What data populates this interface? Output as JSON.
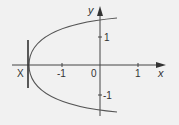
{
  "diagram": {
    "type": "parabola-graph",
    "axes": {
      "x_label": "x",
      "y_label": "y",
      "origin_label": "0",
      "x_ticks": [
        {
          "value": -1,
          "label": "-1"
        },
        {
          "value": 1,
          "label": "1"
        }
      ],
      "y_ticks": [
        {
          "value": 1,
          "label": "1"
        },
        {
          "value": -1,
          "label": "-1"
        }
      ]
    },
    "curve": {
      "description": "Parabola opening to the right, vertex on x-axis left of -1",
      "vertex_x_approx": -1.85,
      "color": "#555555"
    },
    "vertical_line": {
      "label": "X",
      "position": "through parabola vertex",
      "color": "#333333"
    },
    "colors": {
      "background": "#f1f1f1",
      "ink": "#333333"
    }
  }
}
